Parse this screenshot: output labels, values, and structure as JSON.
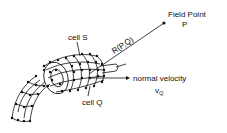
{
  "diagram": {
    "labels": {
      "field_point": "Field Point",
      "field_point_symbol": "P",
      "distance": "R(P,Q)",
      "cell_s": "cell S",
      "cell_q": "cell Q",
      "normal_velocity": "normal velocity",
      "velocity_symbol": "v",
      "velocity_subscript": "Q"
    },
    "colors": {
      "ink": "#111111",
      "background": "#ffffff"
    }
  }
}
